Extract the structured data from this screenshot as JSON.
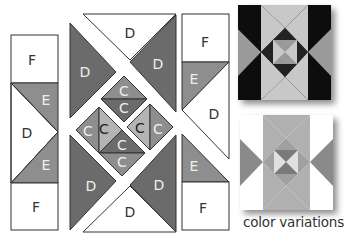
{
  "colors": {
    "dark": "#6b6b6b",
    "medium": "#8e8e8e",
    "light": "#b4b4b4",
    "white": "#ffffff",
    "stroke": "#333333",
    "label_dark": "#333333",
    "label_light": "#e8e8e8",
    "variation_black": "#111111",
    "variation_light": "#c8c8c8",
    "variation_gray": "#9a9a9a"
  },
  "left_column": {
    "top_square": "F",
    "top_triangle": "E",
    "middle_triangle": "D",
    "bottom_triangle": "E",
    "bottom_square": "F"
  },
  "center": {
    "top_triangle": "D",
    "upper_left_triangle": "D",
    "upper_right_triangle": "D",
    "lower_left_triangle": "D",
    "lower_right_triangle": "D",
    "bottom_triangle": "D",
    "center_pieces": [
      "C",
      "C",
      "C",
      "C",
      "C",
      "C",
      "C",
      "C"
    ]
  },
  "right_column": {
    "top_square": "F",
    "top_triangle": "E",
    "middle_triangle": "D",
    "bottom_triangle": "E",
    "bottom_square": "F"
  },
  "caption": "color variations"
}
